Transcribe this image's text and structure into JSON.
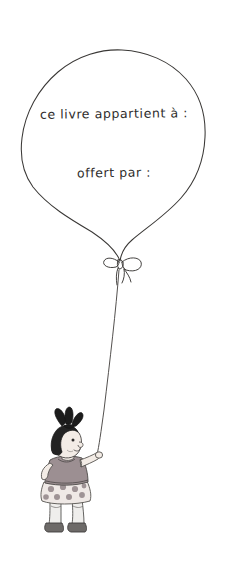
{
  "illustration": {
    "title": "Ballon avec dedicace et petite fille",
    "background_color": "#ffffff",
    "ink_color": "#3a3836",
    "balloon": {
      "name": "balloon-outline",
      "fill_color": "#ffffff",
      "stroke_color": "#3a3836",
      "text_lines": [
        {
          "id": "owner",
          "text": "ce livre appartient à :"
        },
        {
          "id": "giver",
          "text": "offert par :"
        }
      ],
      "knot": {
        "name": "balloon-bow",
        "label": "noeud"
      },
      "string": {
        "name": "balloon-string",
        "label": "ficelle"
      }
    },
    "girl": {
      "name": "girl-figure",
      "label": "petite fille",
      "hair_color": "#232323",
      "hair_bow_color": "#1c1c1c",
      "skin_color": "#f3ece6",
      "top_color": "#9c8f92",
      "skirt_color": "#efe9e6",
      "skirt_dot_color": "#9e9395",
      "shoe_color": "#6d6a68",
      "sock_color": "#efeeec"
    }
  }
}
